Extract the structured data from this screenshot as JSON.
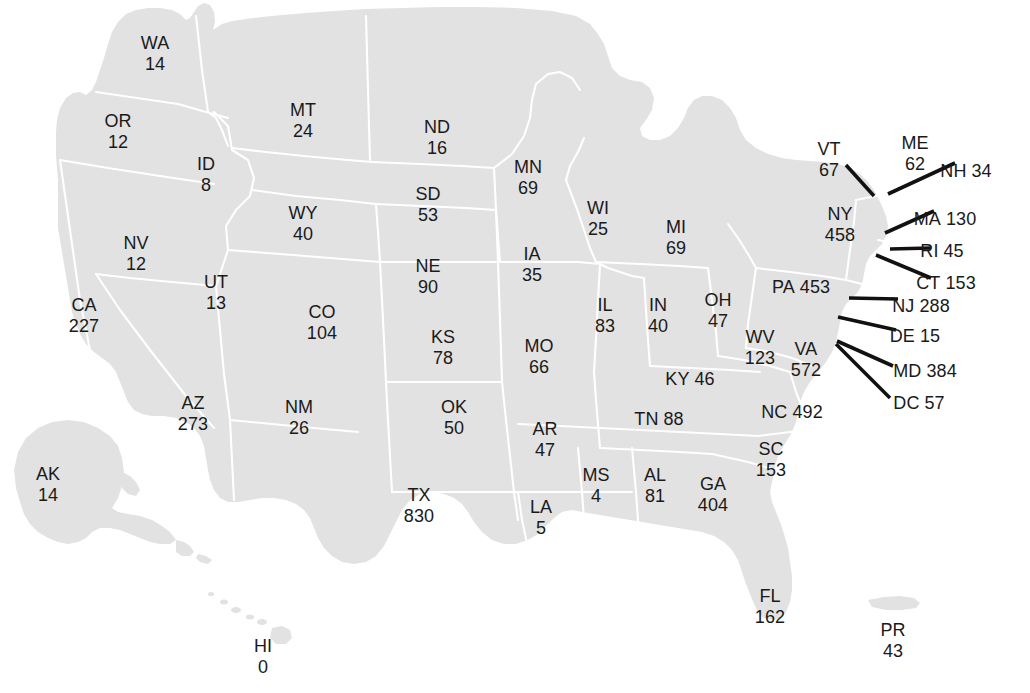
{
  "map": {
    "title": "United States state value map",
    "colors": {
      "land": "#e2e2e2",
      "border": "#ffffff",
      "background": "#ffffff",
      "text": "#1a1a1a",
      "leader_line": "#111111"
    }
  },
  "chart_data": {
    "type": "map",
    "title": "",
    "subtitle": "",
    "xlabel": "",
    "ylabel": "",
    "legend": [],
    "region_key": "US state abbreviation",
    "value_key": "count",
    "categories": [
      "WA",
      "OR",
      "MT",
      "ID",
      "ND",
      "SD",
      "MN",
      "WI",
      "MI",
      "WY",
      "NE",
      "IA",
      "IL",
      "IN",
      "OH",
      "NV",
      "UT",
      "CO",
      "KS",
      "MO",
      "KY",
      "WV",
      "VA",
      "CA",
      "AZ",
      "NM",
      "OK",
      "AR",
      "TN",
      "NC",
      "SC",
      "MS",
      "AL",
      "GA",
      "TX",
      "LA",
      "FL",
      "AK",
      "HI",
      "PR",
      "VT",
      "NH",
      "ME",
      "NY",
      "MA",
      "RI",
      "CT",
      "PA",
      "NJ",
      "DE",
      "MD",
      "DC"
    ],
    "values": [
      14,
      12,
      24,
      8,
      16,
      53,
      69,
      25,
      69,
      40,
      90,
      35,
      83,
      40,
      47,
      12,
      13,
      104,
      78,
      66,
      46,
      123,
      572,
      227,
      273,
      26,
      50,
      47,
      88,
      492,
      153,
      4,
      81,
      404,
      830,
      5,
      162,
      14,
      0,
      43,
      67,
      34,
      62,
      458,
      130,
      45,
      153,
      453,
      288,
      15,
      384,
      57
    ]
  },
  "labels": [
    {
      "abbr": "WA",
      "value": "14",
      "x": 155,
      "y": 54,
      "layout": "stacked"
    },
    {
      "abbr": "OR",
      "value": "12",
      "x": 118,
      "y": 132,
      "layout": "stacked"
    },
    {
      "abbr": "MT",
      "value": "24",
      "x": 303,
      "y": 121,
      "layout": "stacked"
    },
    {
      "abbr": "ID",
      "value": "8",
      "x": 206,
      "y": 175,
      "layout": "stacked"
    },
    {
      "abbr": "ND",
      "value": "16",
      "x": 437,
      "y": 138,
      "layout": "stacked"
    },
    {
      "abbr": "SD",
      "value": "53",
      "x": 428,
      "y": 205,
      "layout": "stacked"
    },
    {
      "abbr": "MN",
      "value": "69",
      "x": 528,
      "y": 178,
      "layout": "stacked"
    },
    {
      "abbr": "WI",
      "value": "25",
      "x": 598,
      "y": 219,
      "layout": "stacked"
    },
    {
      "abbr": "MI",
      "value": "69",
      "x": 676,
      "y": 238,
      "layout": "stacked"
    },
    {
      "abbr": "WY",
      "value": "40",
      "x": 303,
      "y": 224,
      "layout": "stacked"
    },
    {
      "abbr": "NE",
      "value": "90",
      "x": 428,
      "y": 277,
      "layout": "stacked"
    },
    {
      "abbr": "IA",
      "value": "35",
      "x": 532,
      "y": 265,
      "layout": "stacked"
    },
    {
      "abbr": "IL",
      "value": "83",
      "x": 605,
      "y": 316,
      "layout": "stacked"
    },
    {
      "abbr": "IN",
      "value": "40",
      "x": 658,
      "y": 316,
      "layout": "stacked"
    },
    {
      "abbr": "OH",
      "value": "47",
      "x": 718,
      "y": 311,
      "layout": "stacked"
    },
    {
      "abbr": "NV",
      "value": "12",
      "x": 136,
      "y": 254,
      "layout": "stacked"
    },
    {
      "abbr": "UT",
      "value": "13",
      "x": 216,
      "y": 293,
      "layout": "stacked"
    },
    {
      "abbr": "CO",
      "value": "104",
      "x": 322,
      "y": 323,
      "layout": "stacked"
    },
    {
      "abbr": "KS",
      "value": "78",
      "x": 443,
      "y": 348,
      "layout": "stacked"
    },
    {
      "abbr": "MO",
      "value": "66",
      "x": 539,
      "y": 357,
      "layout": "stacked"
    },
    {
      "abbr": "KY",
      "value": "46",
      "x": 690,
      "y": 379,
      "layout": "inline"
    },
    {
      "abbr": "WV",
      "value": "123",
      "x": 760,
      "y": 348,
      "layout": "stacked"
    },
    {
      "abbr": "VA",
      "value": "572",
      "x": 806,
      "y": 360,
      "layout": "stacked"
    },
    {
      "abbr": "CA",
      "value": "227",
      "x": 84,
      "y": 316,
      "layout": "stacked"
    },
    {
      "abbr": "AZ",
      "value": "273",
      "x": 193,
      "y": 414,
      "layout": "stacked"
    },
    {
      "abbr": "NM",
      "value": "26",
      "x": 299,
      "y": 418,
      "layout": "stacked"
    },
    {
      "abbr": "OK",
      "value": "50",
      "x": 454,
      "y": 418,
      "layout": "stacked"
    },
    {
      "abbr": "AR",
      "value": "47",
      "x": 545,
      "y": 440,
      "layout": "stacked"
    },
    {
      "abbr": "TN",
      "value": "88",
      "x": 659,
      "y": 419,
      "layout": "inline"
    },
    {
      "abbr": "NC",
      "value": "492",
      "x": 792,
      "y": 412,
      "layout": "inline"
    },
    {
      "abbr": "SC",
      "value": "153",
      "x": 771,
      "y": 460,
      "layout": "stacked"
    },
    {
      "abbr": "MS",
      "value": "4",
      "x": 596,
      "y": 486,
      "layout": "stacked"
    },
    {
      "abbr": "AL",
      "value": "81",
      "x": 655,
      "y": 486,
      "layout": "stacked"
    },
    {
      "abbr": "GA",
      "value": "404",
      "x": 713,
      "y": 495,
      "layout": "stacked"
    },
    {
      "abbr": "TX",
      "value": "830",
      "x": 419,
      "y": 506,
      "layout": "stacked"
    },
    {
      "abbr": "LA",
      "value": "5",
      "x": 541,
      "y": 518,
      "layout": "stacked"
    },
    {
      "abbr": "FL",
      "value": "162",
      "x": 770,
      "y": 607,
      "layout": "stacked"
    },
    {
      "abbr": "AK",
      "value": "14",
      "x": 48,
      "y": 485,
      "layout": "stacked"
    },
    {
      "abbr": "HI",
      "value": "0",
      "x": 263,
      "y": 657,
      "layout": "stacked"
    },
    {
      "abbr": "PR",
      "value": "43",
      "x": 893,
      "y": 641,
      "layout": "stacked"
    },
    {
      "abbr": "VT",
      "value": "67",
      "x": 829,
      "y": 160,
      "layout": "stacked"
    },
    {
      "abbr": "ME",
      "value": "62",
      "x": 915,
      "y": 154,
      "layout": "stacked"
    },
    {
      "abbr": "NY",
      "value": "458",
      "x": 840,
      "y": 225,
      "layout": "stacked"
    },
    {
      "abbr": "PA",
      "value": "453",
      "x": 801,
      "y": 287,
      "layout": "inline"
    }
  ],
  "callouts": [
    {
      "abbr": "NH",
      "value": "34",
      "text_x": 966,
      "text_y": 171,
      "line": {
        "x1": 955,
        "y1": 163,
        "x2": 888,
        "y2": 194
      }
    },
    {
      "abbr": "MA",
      "value": "130",
      "text_x": 945,
      "text_y": 219,
      "line": {
        "x1": 934,
        "y1": 211,
        "x2": 885,
        "y2": 233
      }
    },
    {
      "abbr": "RI",
      "value": "45",
      "text_x": 942,
      "text_y": 251,
      "line": {
        "x1": 931,
        "y1": 248,
        "x2": 890,
        "y2": 249
      }
    },
    {
      "abbr": "CT",
      "value": "153",
      "text_x": 946,
      "text_y": 283,
      "line": {
        "x1": 931,
        "y1": 278,
        "x2": 876,
        "y2": 255
      }
    },
    {
      "abbr": "NJ",
      "value": "288",
      "text_x": 921,
      "text_y": 306,
      "line": {
        "x1": 898,
        "y1": 299,
        "x2": 849,
        "y2": 298
      }
    },
    {
      "abbr": "DE",
      "value": "15",
      "text_x": 915,
      "text_y": 336,
      "line": {
        "x1": 896,
        "y1": 330,
        "x2": 838,
        "y2": 317
      }
    },
    {
      "abbr": "MD",
      "value": "384",
      "text_x": 925,
      "text_y": 371,
      "line": {
        "x1": 893,
        "y1": 366,
        "x2": 837,
        "y2": 341
      }
    },
    {
      "abbr": "DC",
      "value": "57",
      "text_x": 919,
      "text_y": 403,
      "line": {
        "x1": 890,
        "y1": 398,
        "x2": 836,
        "y2": 344
      }
    },
    {
      "abbr": "VT",
      "value": "",
      "text_x": 0,
      "text_y": 0,
      "line": {
        "x1": 846,
        "y1": 165,
        "x2": 874,
        "y2": 196
      }
    }
  ]
}
